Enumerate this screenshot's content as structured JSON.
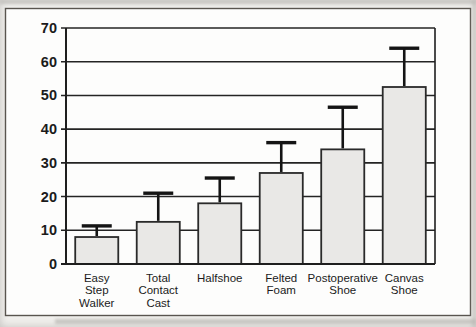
{
  "figure": {
    "kind": "scanned-bar-chart-figure"
  },
  "chart_data": {
    "type": "bar",
    "title": "",
    "xlabel": "",
    "ylabel": "",
    "categories": [
      "Easy Step Walker",
      "Total Contact Cast",
      "Halfshoe",
      "Felted Foam",
      "Postoperative Shoe",
      "Canvas Shoe"
    ],
    "category_label_lines": [
      [
        "Easy",
        "Step",
        "Walker"
      ],
      [
        "Total",
        "Contact",
        "Cast"
      ],
      [
        "Halfshoe"
      ],
      [
        "Felted",
        "Foam"
      ],
      [
        "Postoperative",
        "Shoe"
      ],
      [
        "Canvas",
        "Shoe"
      ]
    ],
    "values": [
      8,
      12.5,
      18,
      27,
      34,
      52.5
    ],
    "errors_plus": [
      3.3,
      8.5,
      7.5,
      9,
      12.5,
      11.5
    ],
    "error_direction": "upper-only",
    "ylim": [
      0,
      70
    ],
    "yticks": [
      0,
      10,
      20,
      30,
      40,
      50,
      60,
      70
    ],
    "grid": "horizontal",
    "legend": "none",
    "colors": {
      "page_bg": "#f1f0ed",
      "plot_bg": "#fdfdfc",
      "frame_border": "#59554f",
      "grid": "#242424",
      "axis": "#1e1e1e",
      "bar_fill": "#e9e8e6",
      "bar_stroke": "#2a2a2a",
      "error": "#141414",
      "text": "#1b1b1b"
    }
  }
}
